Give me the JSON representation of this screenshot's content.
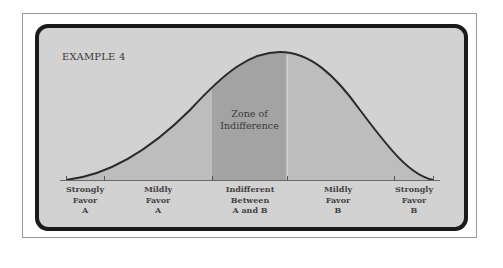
{
  "title": "EXAMPLE 4",
  "zone": {
    "line1": "Zone of",
    "line2": "Indifference"
  },
  "axis_labels": [
    {
      "lines": [
        "Strongly",
        "Favor",
        "A"
      ]
    },
    {
      "lines": [
        "Mildly",
        "Favor",
        "A"
      ]
    },
    {
      "lines": [
        "Indifferent",
        "Between",
        "A and B"
      ]
    },
    {
      "lines": [
        "Mildly",
        "Favor",
        "B"
      ]
    },
    {
      "lines": [
        "Strongly",
        "Favor",
        "B"
      ]
    }
  ],
  "colors": {
    "panel_bg": "#d2d2d2",
    "area_fill": "#b9b9b9",
    "zone_fill": "#a2a2a2",
    "curve": "#2a2a2a",
    "border": "#1a1a1a"
  }
}
